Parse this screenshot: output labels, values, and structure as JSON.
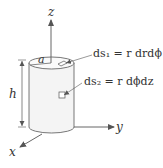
{
  "diagram": {
    "axes": {
      "x": "x",
      "y": "y",
      "z": "z"
    },
    "labels": {
      "radius": "a",
      "height": "h",
      "ds1": "ds₁ = r drdϕ",
      "ds2": "ds₂ = r dϕdz"
    },
    "colors": {
      "stroke": "#555555",
      "fill": "#f4f4f4",
      "text": "#333333"
    }
  }
}
